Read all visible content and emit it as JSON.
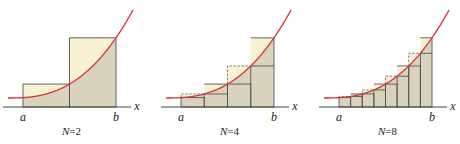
{
  "colors": {
    "curve": "#d6333a",
    "lower_fill": "#d9d2bd",
    "upper_fill": "#f8f1d2",
    "edge": "#555555",
    "dashed": "#777777",
    "axis": "#444444"
  },
  "panels": [
    {
      "caption": "N=2",
      "x_label": "x",
      "a_label": "a",
      "b_label": "b",
      "n": 2,
      "offset_x": 0,
      "caption_x": 70
    },
    {
      "caption": "N=4",
      "x_label": "x",
      "a_label": "a",
      "b_label": "b",
      "n": 4,
      "offset_x": 158,
      "caption_x": 226
    },
    {
      "caption": "N=8",
      "x_label": "x",
      "a_label": "a",
      "b_label": "b",
      "n": 8,
      "offset_x": 316,
      "caption_x": 390
    }
  ]
}
